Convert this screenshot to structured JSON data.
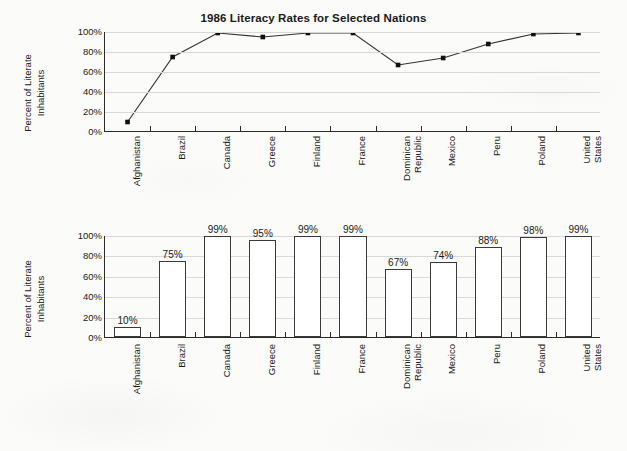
{
  "page": {
    "title": "1986 Literacy Rates for Selected Nations",
    "background_color": "#fbfbf9",
    "ink_color": "#1a1a1a",
    "gridline_color": "#d8d8d8",
    "axis_color": "#2b2b2b"
  },
  "y_axis": {
    "label_line1": "Percent of Literate",
    "label_line2": "Inhabitants",
    "ticks": [
      "100%",
      "80%",
      "60%",
      "40%",
      "20%",
      "0%"
    ]
  },
  "chart_data": [
    {
      "type": "line",
      "title": "1986 Literacy Rates for Selected Nations",
      "xlabel": "",
      "ylabel": "Percent of Literate Inhabitants",
      "ylim": [
        0,
        100
      ],
      "yticks": [
        0,
        20,
        40,
        60,
        80,
        100
      ],
      "ytick_labels": [
        "0%",
        "20%",
        "40%",
        "60%",
        "80%",
        "100%"
      ],
      "grid": true,
      "legend": "none",
      "marker": "filled-square",
      "categories": [
        "Afghanistan",
        "Brazil",
        "Canada",
        "Greece",
        "Finland",
        "France",
        "Dominican\nRepublic",
        "Mexico",
        "Peru",
        "Poland",
        "United\nStates"
      ],
      "values": [
        10,
        75,
        99,
        95,
        99,
        99,
        67,
        74,
        88,
        98,
        99
      ]
    },
    {
      "type": "bar",
      "title": "",
      "xlabel": "",
      "ylabel": "Percent of Literate Inhabitants",
      "ylim": [
        0,
        100
      ],
      "yticks": [
        0,
        20,
        40,
        60,
        80,
        100
      ],
      "ytick_labels": [
        "0%",
        "20%",
        "40%",
        "60%",
        "80%",
        "100%"
      ],
      "grid": true,
      "legend": "none",
      "bar_fill": "#ffffff",
      "bar_edge": "#3a3a3a",
      "categories": [
        "Afghanistan",
        "Brazil",
        "Canada",
        "Greece",
        "Finland",
        "France",
        "Dominican\nRepublic",
        "Mexico",
        "Peru",
        "Poland",
        "United\nStates"
      ],
      "values": [
        10,
        75,
        99,
        95,
        99,
        99,
        67,
        74,
        88,
        98,
        99
      ],
      "data_labels": [
        "10%",
        "75%",
        "99%",
        "95%",
        "99%",
        "99%",
        "67%",
        "74%",
        "88%",
        "98%",
        "99%"
      ]
    }
  ]
}
